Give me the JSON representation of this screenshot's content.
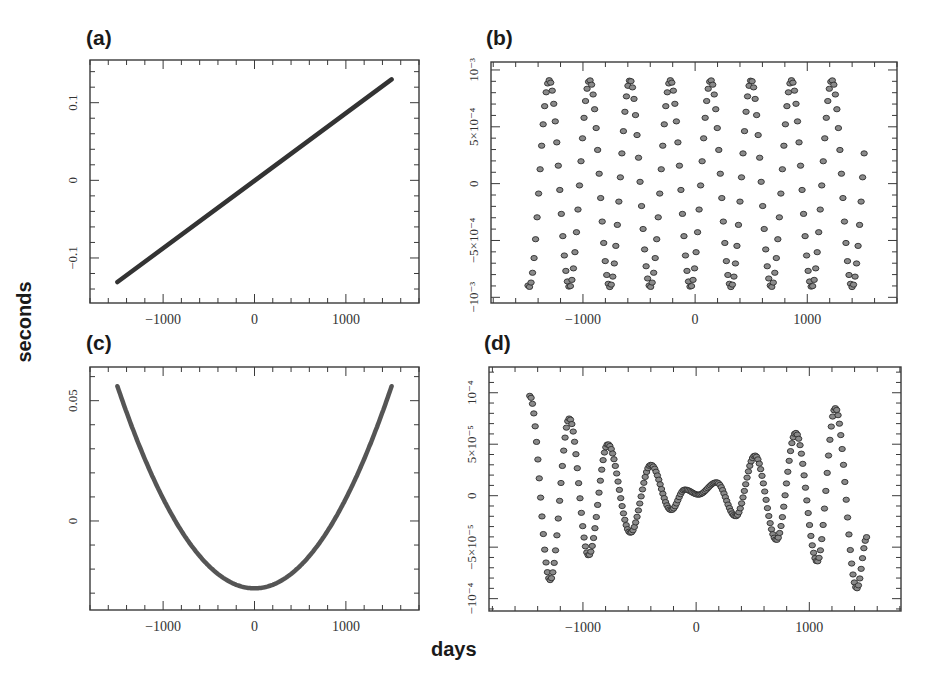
{
  "figure": {
    "global_ylabel": "seconds",
    "global_xlabel": "days"
  },
  "chart_data": [
    {
      "id": "a",
      "panel_label": "(a)",
      "type": "line",
      "xlabel": "days",
      "ylabel": "seconds",
      "xlim": [
        -1800,
        1800
      ],
      "ylim": [
        -0.158,
        0.155
      ],
      "xticks": [
        -1000,
        0,
        1000
      ],
      "xtick_labels": [
        "−1000",
        "0",
        "1000"
      ],
      "yticks": [
        -0.1,
        0,
        0.1
      ],
      "ytick_labels": [
        "−0.1",
        "0",
        "0.1"
      ],
      "x_minor_step": 200,
      "y_minor_step": 0.02,
      "grid": false,
      "description": "Linear trend",
      "series": [
        {
          "name": "linear",
          "x": [
            -1500,
            1500
          ],
          "y": [
            -0.131,
            0.13
          ]
        }
      ]
    },
    {
      "id": "b",
      "panel_label": "(b)",
      "type": "scatter",
      "xlabel": "days",
      "ylabel": "seconds",
      "xlim": [
        -1820,
        1800
      ],
      "ylim": [
        -0.00105,
        0.00107
      ],
      "xticks": [
        -1000,
        0,
        1000
      ],
      "xtick_labels": [
        "−1000",
        "0",
        "1000"
      ],
      "yticks": [
        -0.001,
        -0.0005,
        0,
        0.0005,
        0.001
      ],
      "ytick_labels": [
        "−10⁻³",
        "−5×10⁻⁴",
        "0",
        "5×10⁻⁴",
        "10⁻³"
      ],
      "x_minor_step": 200,
      "y_minor_step": 0.0001,
      "grid": false,
      "description": "Annual sinusoid, amplitude ~9e-4 s, period ~360 days",
      "series": [
        {
          "name": "annual",
          "amplitude": 0.00091,
          "period_days": 360,
          "peak_day": 140,
          "x_start": -1490,
          "x_end": 1510,
          "step_days": 13.5
        }
      ],
      "extrema": {
        "peaks_x": [
          -1300,
          -940,
          -580,
          -220,
          140,
          500,
          860,
          1220
        ],
        "peak_y": 0.00091,
        "troughs_x": [
          -1480,
          -1120,
          -760,
          -400,
          -40,
          320,
          680,
          1040,
          1400
        ],
        "trough_y": -0.00091
      }
    },
    {
      "id": "c",
      "panel_label": "(c)",
      "type": "line",
      "xlabel": "days",
      "ylabel": "seconds",
      "xlim": [
        -1800,
        1800
      ],
      "ylim": [
        -0.037,
        0.064
      ],
      "xticks": [
        -1000,
        0,
        1000
      ],
      "xtick_labels": [
        "−1000",
        "0",
        "1000"
      ],
      "yticks": [
        0,
        0.05
      ],
      "ytick_labels": [
        "0",
        "0.05"
      ],
      "x_minor_step": 200,
      "y_minor_step": 0.01,
      "grid": false,
      "description": "Quadratic trend, minimum near day 0",
      "series": [
        {
          "name": "quadratic",
          "vertex_x": 0,
          "vertex_y": -0.028,
          "end_y": 0.056,
          "x_start": -1500,
          "x_end": 1500
        }
      ]
    },
    {
      "id": "d",
      "panel_label": "(d)",
      "type": "scatter",
      "xlabel": "days",
      "ylabel": "seconds",
      "xlim": [
        -1830,
        1810
      ],
      "ylim": [
        -0.000112,
        0.000125
      ],
      "xticks": [
        -1000,
        0,
        1000
      ],
      "xtick_labels": [
        "−1000",
        "0",
        "1000"
      ],
      "yticks": [
        -0.0001,
        -5e-05,
        0,
        5e-05,
        0.0001
      ],
      "ytick_labels": [
        "−10⁻⁴",
        "−5×10⁻⁵",
        "0",
        "5×10⁻⁵",
        "10⁻⁴"
      ],
      "x_minor_step": 200,
      "y_minor_step": 1e-05,
      "grid": false,
      "description": "Residual oscillation with amplitude growing away from day 0",
      "series": [
        {
          "name": "residual",
          "step_days": 12,
          "extrema_x": [
            -1470,
            -1290,
            -1120,
            -950,
            -780,
            -580,
            -400,
            -220,
            -100,
            20,
            180,
            350,
            520,
            710,
            880,
            1070,
            1230,
            1420,
            1510
          ],
          "extrema_y": [
            9.7e-05,
            -8.2e-05,
            7.5e-05,
            -5.8e-05,
            5e-05,
            -3.6e-05,
            3e-05,
            -1.4e-05,
            6e-06,
            1e-06,
            1.3e-05,
            -2e-05,
            3.9e-05,
            -4.3e-05,
            6.1e-05,
            -6.4e-05,
            8.5e-05,
            -9e-05,
            -4e-05
          ]
        }
      ]
    }
  ],
  "layout": {
    "panels": {
      "a": {
        "left": 90,
        "top": 60,
        "width": 329,
        "height": 243,
        "label_left": 86,
        "label_top": 26
      },
      "b": {
        "left": 491,
        "top": 62,
        "width": 406,
        "height": 241,
        "label_left": 486,
        "label_top": 26
      },
      "c": {
        "left": 90,
        "top": 367,
        "width": 329,
        "height": 243,
        "label_left": 86,
        "label_top": 331
      },
      "d": {
        "left": 489,
        "top": 367,
        "width": 412,
        "height": 244,
        "label_left": 484,
        "label_top": 331
      }
    },
    "colors": {
      "frame": "#3a3a3a",
      "line": "#333333",
      "marker_fill": "#8a8a8a",
      "marker_stroke": "#2e2e2e"
    }
  }
}
